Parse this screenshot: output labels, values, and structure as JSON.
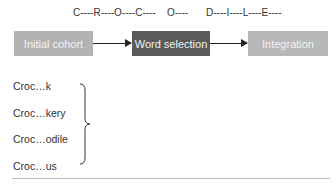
{
  "letters": {
    "group1": "C----R----O----C----",
    "group2": "O----",
    "group3": "D----I----L----E----"
  },
  "stages": [
    {
      "label": "Initial cohort",
      "color": "#b3b3b3"
    },
    {
      "label": "Word selection",
      "color": "#5a5a5a"
    },
    {
      "label": "Integration",
      "color": "#b8b8b8"
    }
  ],
  "candidates": [
    "Croc…k",
    "Croc…kery",
    "Croc…odile",
    "Croc…us"
  ]
}
